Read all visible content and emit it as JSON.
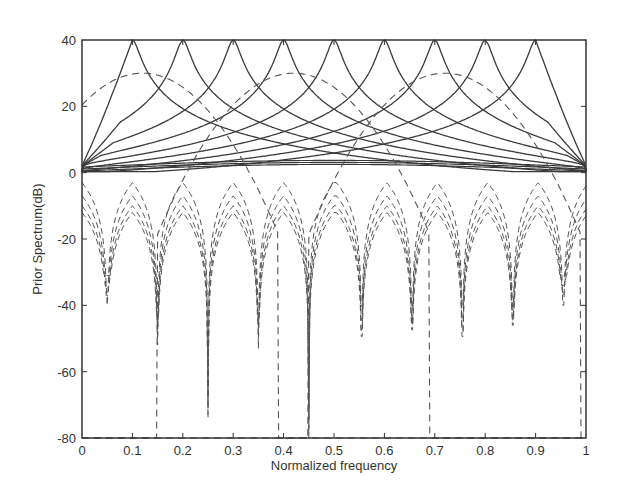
{
  "chart_data": {
    "type": "line",
    "title": "",
    "xlabel": "Normalized frequency",
    "ylabel": "Prior Spectrum(dB)",
    "xlim": [
      0,
      1
    ],
    "ylim": [
      -80,
      40
    ],
    "xticks": [
      0,
      0.1,
      0.2,
      0.3,
      0.4,
      0.5,
      0.6,
      0.7,
      0.8,
      0.9,
      1
    ],
    "xtick_labels": [
      "0",
      "0.1",
      "0.2",
      "0.3",
      "0.4",
      "0.5",
      "0.6",
      "0.7",
      "0.8",
      "0.9",
      "1"
    ],
    "yticks": [
      40,
      20,
      0,
      -20,
      -40,
      -60,
      -80
    ],
    "ytick_labels": [
      "40",
      "20",
      "0",
      "-20",
      "-40",
      "-60",
      "-80"
    ],
    "grid": false,
    "legend": null,
    "series": [
      {
        "name": "solid-peaks",
        "style": "solid",
        "color": "#3a3a3a",
        "description": "9 resonant peaks, each reaching 40 dB, decaying toward ~0 dB",
        "peak_x": [
          0.1,
          0.2,
          0.3,
          0.4,
          0.5,
          0.6,
          0.7,
          0.8,
          0.9
        ],
        "peak_y": 40,
        "edge_y": 0
      },
      {
        "name": "dashed-envelope",
        "style": "dashed",
        "color": "#555555",
        "description": "Dashed spectra with arcs near 30 dB and deep nulls between peaks",
        "arc_level_db": 30,
        "null_x": [
          0.05,
          0.15,
          0.25,
          0.35,
          0.45,
          0.555,
          0.655,
          0.755,
          0.855,
          0.955
        ],
        "null_y": [
          -40,
          -52,
          -74,
          -53,
          -80,
          -80,
          -55,
          -75,
          -52,
          -40
        ],
        "lobe_levels_db": [
          -3,
          -7,
          -10,
          -12
        ]
      }
    ]
  }
}
